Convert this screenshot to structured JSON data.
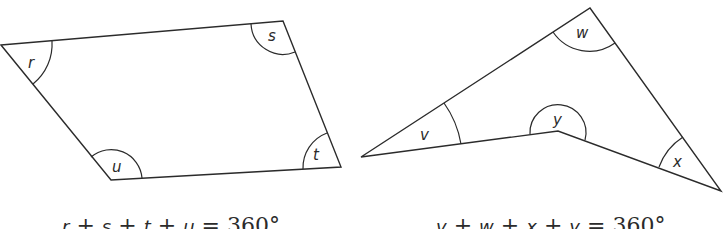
{
  "figures": [
    {
      "name": "quadrilateral-convex",
      "vertices": {
        "r": [
          1,
          45
        ],
        "s": [
          283,
          21
        ],
        "t": [
          341,
          167
        ],
        "u": [
          111,
          180
        ]
      },
      "angle_labels": [
        "r",
        "s",
        "t",
        "u"
      ],
      "equation": {
        "terms": [
          "r",
          "s",
          "t",
          "u"
        ],
        "operator": "+",
        "equals": "=",
        "total": "360°",
        "text": "r + s + t + u = 360°"
      }
    },
    {
      "name": "quadrilateral-concave",
      "vertices": {
        "v": [
          361,
          157
        ],
        "w": [
          590,
          8
        ],
        "x": [
          721,
          191
        ],
        "y": [
          558,
          131
        ]
      },
      "angle_labels": [
        "v",
        "w",
        "x",
        "y"
      ],
      "equation": {
        "terms": [
          "v",
          "w",
          "x",
          "y"
        ],
        "operator": "+",
        "equals": "=",
        "total": "360°",
        "text": "v + w + x + y = 360°"
      }
    }
  ],
  "colors": {
    "line": "#2b2b2b",
    "background": "#ffffff"
  }
}
